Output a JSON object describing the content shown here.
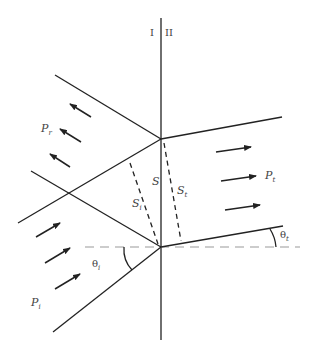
{
  "diagram": {
    "type": "wave refraction at a medium boundary",
    "regions": {
      "left": "I",
      "right": "II"
    },
    "labels": {
      "reflected_power": {
        "base": "P",
        "sub": "r"
      },
      "incident_power": {
        "base": "P",
        "sub": "i"
      },
      "transmitted_power": {
        "base": "P",
        "sub": "t"
      },
      "interface_segment": {
        "base": "S",
        "sub": ""
      },
      "incident_segment": {
        "base": "S",
        "sub": "i"
      },
      "transmitted_segment": {
        "base": "S",
        "sub": "t"
      },
      "incident_angle": {
        "base": "θ",
        "sub": "i"
      },
      "transmitted_angle": {
        "base": "θ",
        "sub": "t"
      }
    },
    "colors": {
      "line": "#222222",
      "dashed": "#999999",
      "text": "#444444"
    }
  }
}
